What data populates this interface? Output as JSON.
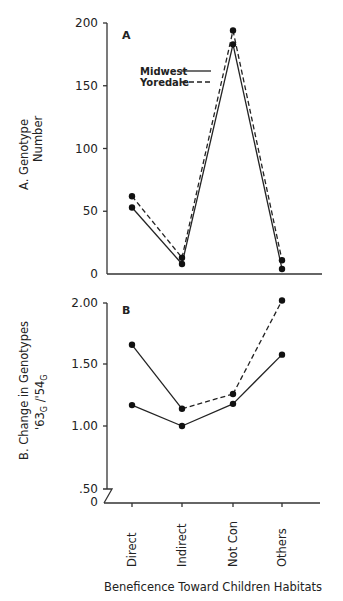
{
  "chart_data": [
    {
      "type": "line",
      "panel": "A",
      "title": "",
      "ylabel": "A. Genotype Number",
      "xlabel": "Beneficence Toward Children Habitats",
      "categories": [
        "Direct",
        "Indirect",
        "Not Con",
        "Others"
      ],
      "yticks": [
        "0",
        "50",
        "100",
        "150",
        "200"
      ],
      "ylim": [
        0,
        200
      ],
      "legend": [
        {
          "name": "Midwest",
          "style": "solid"
        },
        {
          "name": "Yoredale",
          "style": "dashed"
        }
      ],
      "series": [
        {
          "name": "Midwest",
          "style": "solid",
          "values": [
            53,
            8,
            183,
            4
          ]
        },
        {
          "name": "Yoredale",
          "style": "dashed",
          "values": [
            62,
            13,
            194,
            11
          ]
        }
      ]
    },
    {
      "type": "line",
      "panel": "B",
      "title": "",
      "ylabel_line1": "B. Change in Genotypes",
      "ylabel_line2": "'63G / '54G",
      "xlabel": "Beneficence Toward Children Habitats",
      "categories": [
        "Direct",
        "Indirect",
        "Not Con",
        "Others"
      ],
      "yticks": [
        "0",
        ".50",
        "1.00",
        "1.50",
        "2.00"
      ],
      "ylim": [
        0,
        2.0
      ],
      "axis_break": true,
      "series": [
        {
          "name": "Midwest",
          "style": "solid",
          "values": [
            1.17,
            1.0,
            1.18,
            1.58
          ]
        },
        {
          "name": "Yoredale",
          "style": "solid-then-dashed",
          "values": [
            1.66,
            1.14,
            1.26,
            2.02
          ]
        }
      ]
    }
  ],
  "labels": {
    "panel_a_letter": "A",
    "panel_b_letter": "B",
    "legend_midwest": "Midwest",
    "legend_yoredale": "Yoredale",
    "ylabel_a_line1": "A.  Genotype",
    "ylabel_a_line2": "Number",
    "ylabel_b_line1": "B.  Change  in  Genotypes",
    "ylabel_b_sub_63": "'63",
    "ylabel_b_sub_54": "'54",
    "ylabel_b_sub_g": "G",
    "xlabel": "Beneficence  Toward  Children  Habitats",
    "categories": [
      "Direct",
      "Indirect",
      "Not Con",
      "Others"
    ],
    "yticks_a": [
      "200",
      "150",
      "100",
      "50",
      "0"
    ],
    "yticks_b": [
      "2.00",
      "1.50",
      "1.00",
      ".50",
      "0"
    ]
  }
}
